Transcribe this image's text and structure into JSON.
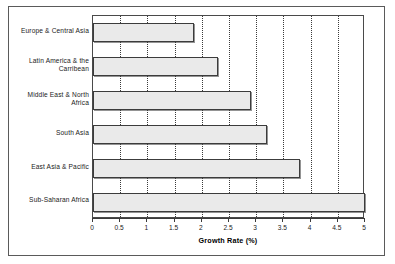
{
  "chart_data": {
    "type": "bar",
    "orientation": "horizontal",
    "title": "",
    "xlabel": "Growth Rate (%)",
    "ylabel": "",
    "xlim": [
      0,
      5
    ],
    "xticks": [
      "0",
      "0.5",
      "1",
      "1.5",
      "2",
      "2.5",
      "3",
      "3.5",
      "4",
      "4.5",
      "5"
    ],
    "xtick_values": [
      0,
      0.5,
      1,
      1.5,
      2,
      2.5,
      3,
      3.5,
      4,
      4.5,
      5
    ],
    "grid": "vertical-dotted",
    "legend": "none",
    "categories": [
      "Europe & Central Asia",
      "Latin America & the Carribean",
      "Middle East & North Africa",
      "South Asia",
      "East Asia & Pacific",
      "Sub-Saharan Africa"
    ],
    "values": [
      1.85,
      2.3,
      2.9,
      3.2,
      3.8,
      5.0
    ],
    "bar_fill_color": "#eaeaea",
    "bar_edge_color": "#3c3c3c"
  },
  "axis": {
    "x_title": "Growth Rate (%)"
  }
}
